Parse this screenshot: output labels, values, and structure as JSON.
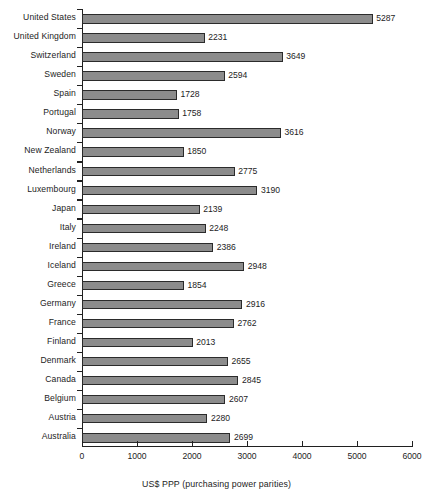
{
  "chart_data": {
    "type": "bar",
    "orientation": "horizontal",
    "title": "",
    "xlabel": "US$ PPP (purchasing power parities)",
    "ylabel": "",
    "xlim": [
      0,
      6000
    ],
    "xticks": [
      0,
      1000,
      2000,
      3000,
      4000,
      5000,
      6000
    ],
    "xtick_labels": [
      "0",
      "1000",
      "2000",
      "3000",
      "4000",
      "5000",
      "6000"
    ],
    "grid": false,
    "legend": null,
    "bar_color": "#8c8c8c",
    "bar_border_color": "#2b2b2b",
    "axis_color": "#202020",
    "background": "#ffffff",
    "categories": [
      "United States",
      "United Kingdom",
      "Switzerland",
      "Sweden",
      "Spain",
      "Portugal",
      "Norway",
      "New Zealand",
      "Netherlands",
      "Luxembourg",
      "Japan",
      "Italy",
      "Ireland",
      "Iceland",
      "Greece",
      "Germany",
      "France",
      "Finland",
      "Denmark",
      "Canada",
      "Belgium",
      "Austria",
      "Australia"
    ],
    "values": [
      5287,
      2231,
      3649,
      2594,
      1728,
      1758,
      3616,
      1850,
      2775,
      3190,
      2139,
      2248,
      2386,
      2948,
      1854,
      2916,
      2762,
      2013,
      2655,
      2845,
      2607,
      2280,
      2699
    ],
    "value_labels": [
      "5287",
      "2231",
      "3649",
      "2594",
      "1728",
      "1758",
      "3616",
      "1850",
      "2775",
      "3190",
      "2139",
      "2248",
      "2386",
      "2948",
      "1854",
      "2916",
      "2762",
      "2013",
      "2655",
      "2845",
      "2607",
      "2280",
      "2699"
    ]
  }
}
